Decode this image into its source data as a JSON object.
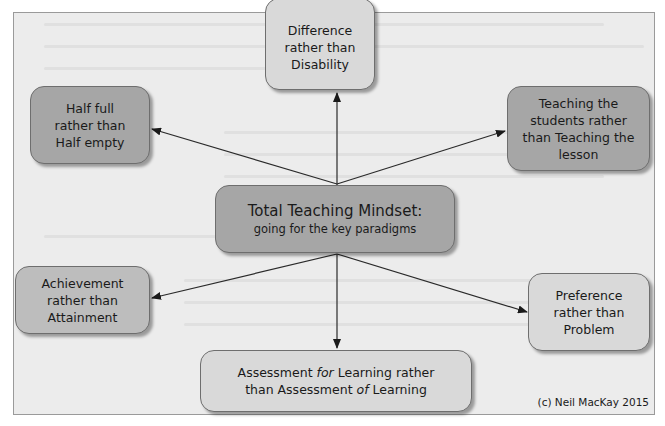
{
  "diagram": {
    "center": {
      "title": "Total Teaching Mindset:",
      "subtitle": "going for the key paradigms"
    },
    "nodes": [
      {
        "id": "difference",
        "lines": [
          "Difference",
          "rather than",
          "Disability"
        ],
        "tone": "light"
      },
      {
        "id": "half-full",
        "lines": [
          "Half full",
          "rather than",
          "Half empty"
        ],
        "tone": "dark"
      },
      {
        "id": "teaching",
        "lines": [
          "Teaching the",
          "students rather",
          "than Teaching the",
          "lesson"
        ],
        "tone": "dark"
      },
      {
        "id": "achievement",
        "lines": [
          "Achievement",
          "rather than",
          "Attainment"
        ],
        "tone": "light"
      },
      {
        "id": "preference",
        "lines": [
          "Preference",
          "rather than",
          "Problem"
        ],
        "tone": "light"
      },
      {
        "id": "assessment",
        "line1_a": "Assessment ",
        "line1_em": "for",
        "line1_b": " Learning rather",
        "line2_a": "than Assessment ",
        "line2_em": "of",
        "line2_b": " Learning",
        "tone": "light"
      }
    ],
    "copyright": "(c) Neil MacKay 2015",
    "colors": {
      "frame_bg": "#ececec",
      "dark_box": "#a6a6a6",
      "light_box": "#d9d9d9",
      "border": "#6e6e6e",
      "arrow": "#1a1a1a"
    }
  }
}
